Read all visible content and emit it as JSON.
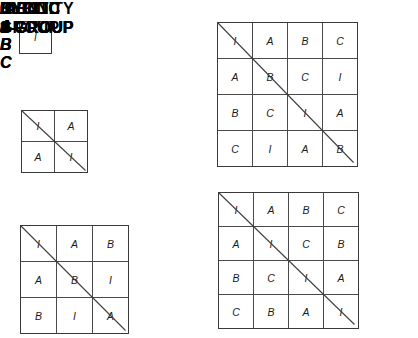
{
  "figure": {
    "line_color": "#3f3f3f",
    "text_color": "#111111"
  },
  "groups": [
    {
      "id": "identity",
      "caption": "IDENTITY\nGROUP",
      "col_headers": [
        "I"
      ],
      "row_headers": [
        "I"
      ],
      "rows": [
        [
          "I"
        ]
      ],
      "diagonal": false
    },
    {
      "id": "cyclic2",
      "caption": "CYCLIC\n2-GROUP",
      "col_headers": [
        "I",
        "A"
      ],
      "row_headers": [
        "I",
        "A"
      ],
      "rows": [
        [
          "I",
          "A"
        ],
        [
          "A",
          "I"
        ]
      ],
      "diagonal": true
    },
    {
      "id": "cyclic3",
      "caption": "CYCLIC\n3-GROUP",
      "col_headers": [
        "I",
        "A",
        "B"
      ],
      "row_headers": [
        "I",
        "A",
        "B"
      ],
      "rows": [
        [
          "I",
          "A",
          "B"
        ],
        [
          "A",
          "B",
          "I"
        ],
        [
          "B",
          "I",
          "A"
        ]
      ],
      "diagonal": true
    },
    {
      "id": "cyclic4",
      "caption": "CYCLIC\n4-GROUP",
      "col_headers": [
        "I",
        "A",
        "B",
        "C"
      ],
      "row_headers": [
        "I",
        "A",
        "B",
        "C"
      ],
      "rows": [
        [
          "I",
          "A",
          "B",
          "C"
        ],
        [
          "A",
          "B",
          "C",
          "I"
        ],
        [
          "B",
          "C",
          "I",
          "A"
        ],
        [
          "C",
          "I",
          "A",
          "B"
        ]
      ],
      "diagonal": true
    },
    {
      "id": "klein4",
      "caption": "KLEIN\n4-GROUP",
      "col_headers": [
        "I",
        "A",
        "B",
        "C"
      ],
      "row_headers": [
        "I",
        "A",
        "B",
        "C"
      ],
      "rows": [
        [
          "I",
          "A",
          "B",
          "C"
        ],
        [
          "A",
          "I",
          "C",
          "B"
        ],
        [
          "B",
          "C",
          "I",
          "A"
        ],
        [
          "C",
          "B",
          "A",
          "I"
        ]
      ],
      "diagonal": true
    }
  ]
}
